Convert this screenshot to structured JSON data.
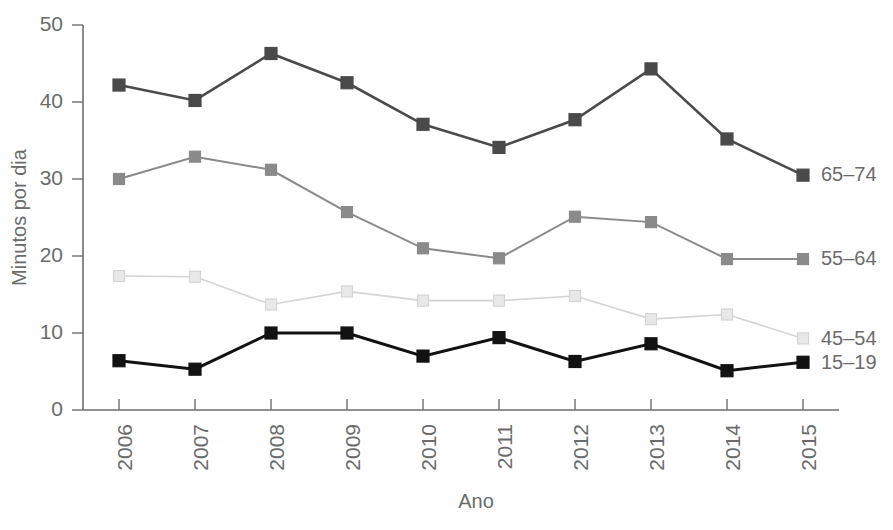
{
  "chart_data": {
    "type": "line",
    "title": "",
    "xlabel": "Ano",
    "ylabel": "Minutos por dia",
    "categories": [
      "2006",
      "2007",
      "2008",
      "2009",
      "2010",
      "2011",
      "2012",
      "2013",
      "2014",
      "2015"
    ],
    "x": [
      2006,
      2007,
      2008,
      2009,
      2010,
      2011,
      2012,
      2013,
      2014,
      2015
    ],
    "xlim": [
      2006,
      2015
    ],
    "ylim": [
      0,
      50
    ],
    "yticks": [
      0,
      10,
      20,
      30,
      40,
      50
    ],
    "ytick_labels": [
      "0",
      "10",
      "20",
      "30",
      "40",
      "50"
    ],
    "grid": false,
    "legend_position": "right-inline-end-of-line",
    "series": [
      {
        "name": "65–74",
        "color": "#4a4a4a",
        "marker": "square",
        "marker_fill": "#4a4a4a",
        "line_width": 2.6,
        "values": [
          42.2,
          40.2,
          46.3,
          42.5,
          37.1,
          34.1,
          37.7,
          44.3,
          35.2,
          30.5
        ]
      },
      {
        "name": "55–64",
        "color": "#8a8a8a",
        "marker": "square",
        "marker_fill": "#8a8a8a",
        "line_width": 2.0,
        "values": [
          30.0,
          32.9,
          31.2,
          25.7,
          21.0,
          19.7,
          25.1,
          24.4,
          19.6,
          19.6
        ]
      },
      {
        "name": "45–54",
        "color": "#d4d4d4",
        "marker": "square",
        "marker_fill": "#e8e8e8",
        "line_width": 1.6,
        "values": [
          17.4,
          17.3,
          13.7,
          15.4,
          14.2,
          14.2,
          14.8,
          11.8,
          12.4,
          9.3
        ]
      },
      {
        "name": "15–19",
        "color": "#121212",
        "marker": "square",
        "marker_fill": "#121212",
        "line_width": 3.0,
        "values": [
          6.4,
          5.3,
          10.0,
          10.0,
          7.0,
          9.4,
          6.3,
          8.6,
          5.1,
          6.2
        ]
      }
    ]
  }
}
